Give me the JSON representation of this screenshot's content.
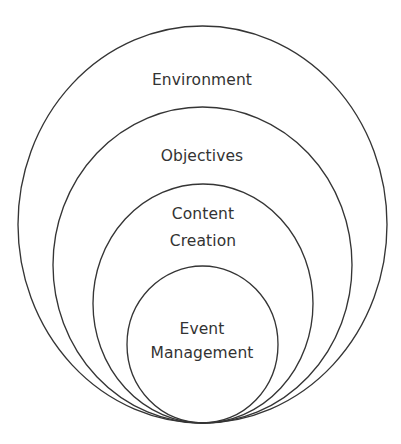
{
  "diagram": {
    "type": "nested-circles",
    "stroke_color": "#353535",
    "text_color": "#333333",
    "background": "#ffffff",
    "layers": [
      {
        "id": "environment",
        "lines": [
          "Environment"
        ],
        "shape": {
          "cx": 202.5,
          "cy": 224.5,
          "rx": 184.5,
          "ry": 198.5
        },
        "label_y": [
          80
        ]
      },
      {
        "id": "objectives",
        "lines": [
          "Objectives"
        ],
        "shape": {
          "cx": 202.5,
          "cy": 265,
          "rx": 149.5,
          "ry": 158
        },
        "label_y": [
          156
        ]
      },
      {
        "id": "content-creation",
        "lines": [
          "Content",
          "Creation"
        ],
        "shape": {
          "cx": 203,
          "cy": 303.5,
          "rx": 110,
          "ry": 119.5
        },
        "label_y": [
          214,
          241
        ]
      },
      {
        "id": "event-management",
        "lines": [
          "Event",
          "Management"
        ],
        "shape": {
          "cx": 202.5,
          "cy": 344.5,
          "rx": 75.5,
          "ry": 78.5
        },
        "label_y": [
          329,
          353
        ]
      }
    ]
  }
}
